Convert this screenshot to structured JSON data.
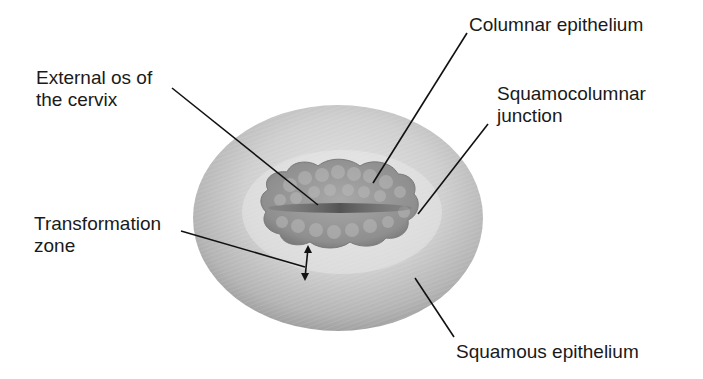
{
  "diagram": {
    "labels": {
      "external_os": [
        "External os of",
        "the cervix"
      ],
      "columnar_epithelium": "Columnar epithelium",
      "squamocolumnar_junction": [
        "Squamocolumnar",
        "junction"
      ],
      "transformation_zone": [
        "Transformation",
        "zone"
      ],
      "squamous_epithelium": "Squamous epithelium"
    },
    "colors": {
      "background": "#ffffff",
      "cervix_outer": "#a9a9a9",
      "cervix_light": "#e2e2e2",
      "columnar_region": "#8e8e8e",
      "os_slit": "#555555",
      "leader_lines": "#111111",
      "text": "#1a1a1a"
    }
  }
}
